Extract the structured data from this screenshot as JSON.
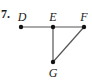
{
  "problem": {
    "number_label": "7."
  },
  "diagram": {
    "points": [
      {
        "name": "D",
        "x": 21,
        "y": 27,
        "label_x": 22,
        "label_y": 21
      },
      {
        "name": "E",
        "x": 53,
        "y": 27,
        "label_x": 53,
        "label_y": 21
      },
      {
        "name": "F",
        "x": 84,
        "y": 27,
        "label_x": 84,
        "label_y": 21
      },
      {
        "name": "G",
        "x": 53,
        "y": 62,
        "label_x": 53,
        "label_y": 77
      }
    ],
    "segments": [
      {
        "from": "D",
        "to": "F",
        "name": "segment-df"
      },
      {
        "from": "E",
        "to": "G",
        "name": "segment-eg"
      },
      {
        "from": "F",
        "to": "G",
        "name": "segment-fg"
      }
    ],
    "colors": {
      "line": "#555555",
      "point": "#111111",
      "text": "#1a1a1a"
    },
    "labels": {
      "D": "D",
      "E": "E",
      "F": "F",
      "G": "G"
    }
  }
}
